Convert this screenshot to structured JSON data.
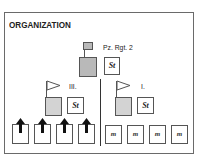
{
  "title": "ORGANIZATION",
  "regiment": {
    "label": "Pz. Rgt. 2",
    "staff_label": "St",
    "hq_color": "#b9b9b9"
  },
  "battalions": [
    {
      "label": "III.",
      "staff_label": "St",
      "hq_color": "#d3d3d3",
      "flag_icon": "pennant-flag-icon",
      "companies": [
        {
          "icon": "arrow-up-icon",
          "label": ""
        },
        {
          "icon": "arrow-up-icon",
          "label": ""
        },
        {
          "icon": "arrow-up-icon",
          "label": ""
        },
        {
          "icon": "arrow-up-icon",
          "label": ""
        }
      ]
    },
    {
      "label": "I.",
      "staff_label": "St",
      "hq_color": "#d3d3d3",
      "flag_icon": "pennant-flag-icon",
      "companies": [
        {
          "icon": "",
          "label": "m"
        },
        {
          "icon": "",
          "label": "m"
        },
        {
          "icon": "",
          "label": "m"
        },
        {
          "icon": "",
          "label": "m"
        }
      ]
    }
  ]
}
